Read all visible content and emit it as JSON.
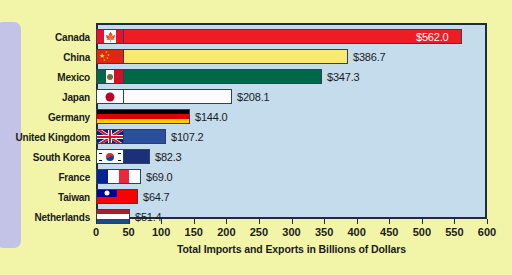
{
  "chart_data": {
    "type": "bar",
    "orientation": "horizontal",
    "title": "",
    "xlabel": "Total Imports and Exports in Billions of Dollars",
    "ylabel": "",
    "xlim": [
      0,
      600
    ],
    "xticks": [
      0,
      50,
      100,
      150,
      200,
      250,
      300,
      350,
      400,
      450,
      500,
      550,
      600
    ],
    "grid": false,
    "legend": "none",
    "categories": [
      "Canada",
      "China",
      "Mexico",
      "Japan",
      "Germany",
      "United Kingdom",
      "South Korea",
      "France",
      "Taiwan",
      "Netherlands"
    ],
    "values": [
      562.0,
      386.7,
      347.3,
      208.1,
      144.0,
      107.2,
      82.3,
      69.0,
      64.7,
      51.4
    ],
    "value_labels": [
      "$562.0",
      "$386.7",
      "$347.3",
      "$208.1",
      "$144.0",
      "$107.2",
      "$82.3",
      "$69.0",
      "$64.7",
      "$51.4"
    ],
    "bars": [
      {
        "country": "Canada",
        "value": 562.0,
        "label": "$562.0",
        "fill": "#ee1c25",
        "flag": "canada-flag-icon",
        "label_inside": true
      },
      {
        "country": "China",
        "value": 386.7,
        "label": "$386.7",
        "fill": "#fbe870",
        "flag": "china-flag-icon",
        "label_inside": false
      },
      {
        "country": "Mexico",
        "value": 347.3,
        "label": "$347.3",
        "fill": "#006847",
        "flag": "mexico-flag-icon",
        "label_inside": false
      },
      {
        "country": "Japan",
        "value": 208.1,
        "label": "$208.1",
        "fill": "#fbfbfb",
        "flag": "japan-flag-icon",
        "label_inside": false
      },
      {
        "country": "Germany",
        "value": 144.0,
        "label": "$144.0",
        "fill": "flag",
        "flag": "germany-flag-icon",
        "label_inside": false
      },
      {
        "country": "United Kingdom",
        "value": 107.2,
        "label": "$107.2",
        "fill": "#2a4f9e",
        "flag": "uk-flag-icon",
        "label_inside": false
      },
      {
        "country": "South Korea",
        "value": 82.3,
        "label": "$82.3",
        "fill": "#1c2f7a",
        "flag": "south-korea-flag-icon",
        "label_inside": false
      },
      {
        "country": "France",
        "value": 69.0,
        "label": "$69.0",
        "fill": "#ffffff",
        "flag": "france-flag-icon",
        "label_inside": false
      },
      {
        "country": "Taiwan",
        "value": 64.7,
        "label": "$64.7",
        "fill": "#fe0000",
        "flag": "taiwan-flag-icon",
        "label_inside": false
      },
      {
        "country": "Netherlands",
        "value": 51.4,
        "label": "$51.4",
        "fill": "flag",
        "flag": "netherlands-flag-icon",
        "label_inside": false
      }
    ],
    "colors": {
      "page_background": "#f2f5a8",
      "plot_background": "#c5dced",
      "plot_border": "#1d2b44",
      "side_tab": "#c3c3e8",
      "text": "#1b1b1b"
    }
  }
}
